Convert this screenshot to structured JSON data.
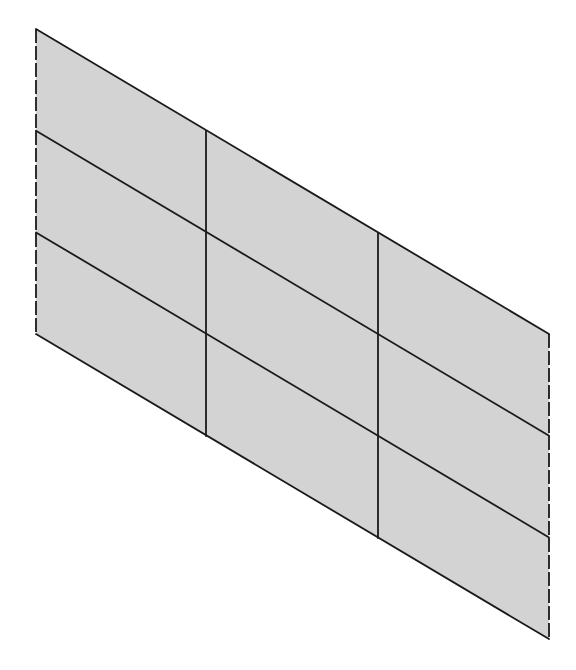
{
  "diagram": {
    "type": "sheared-grid-panel",
    "rows": 3,
    "columns": 3,
    "colors": {
      "fill": "#d3d3d3",
      "line": "#1a1a1a",
      "background": "#ffffff"
    },
    "column_x": [
      36,
      206,
      378,
      549
    ],
    "top_edge_y": [
      29,
      131,
      233,
      334
    ],
    "row_height": 101.7
  }
}
